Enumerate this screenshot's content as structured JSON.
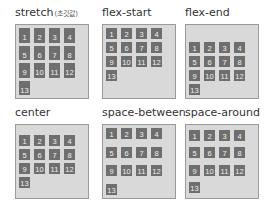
{
  "panels": [
    {
      "label": "stretch",
      "sub": "(초깃값)",
      "mode": "stretch"
    },
    {
      "label": "flex-start",
      "sub": "",
      "mode": "flex-start"
    },
    {
      "label": "flex-end",
      "sub": "",
      "mode": "flex-end"
    },
    {
      "label": "center",
      "sub": "",
      "mode": "center"
    },
    {
      "label": "space-between",
      "sub": "",
      "mode": "space-between"
    },
    {
      "label": "space-around",
      "sub": "",
      "mode": "space-around"
    }
  ],
  "items": [
    "1",
    "2",
    "3",
    "4",
    "5",
    "6",
    "7",
    "8",
    "9",
    "10",
    "11",
    "12",
    "13"
  ],
  "colors": {
    "container_bg": "#d9d9d9",
    "container_border": "#9a9a9a",
    "item_bg": "#6e6e6e",
    "item_text": "#f0f0f0"
  }
}
